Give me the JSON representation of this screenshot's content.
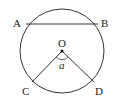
{
  "diagram": {
    "type": "circle-geometry",
    "circle": {
      "cx": 62,
      "cy": 51,
      "r": 42
    },
    "points": {
      "A": {
        "label": "A",
        "x": 22,
        "y": 24
      },
      "B": {
        "label": "B",
        "x": 101,
        "y": 24
      },
      "O": {
        "label": "O",
        "x": 62,
        "y": 51
      },
      "C": {
        "label": "C",
        "x": 32,
        "y": 81
      },
      "D": {
        "label": "D",
        "x": 94,
        "y": 82
      }
    },
    "segments": [
      [
        "A",
        "B"
      ],
      [
        "O",
        "C"
      ],
      [
        "O",
        "D"
      ]
    ],
    "angle_label": "a",
    "stroke_color": "#333333"
  }
}
